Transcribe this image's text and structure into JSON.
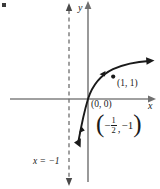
{
  "figure": {
    "type": "cartesian-graph",
    "axes": {
      "x_label": "x",
      "y_label": "y",
      "origin_label": "(0, 0)"
    },
    "asymptote": {
      "label": "x = −1",
      "equation_x": -1,
      "style": "dashed"
    },
    "points": [
      {
        "label": "(1, 1)",
        "x": 1,
        "y": 1,
        "marked": true
      },
      {
        "label_display": "(−½, −1)",
        "x": -0.5,
        "y": -1,
        "marked": false
      }
    ],
    "point2_parts": {
      "open_paren": "(",
      "minus": "−",
      "numerator": "1",
      "denominator": "2",
      "comma": ",",
      "second": "−1",
      "close_paren": ")"
    },
    "colors": {
      "axis": "#808080",
      "curve": "#1a1a1a",
      "asymptote": "#666666",
      "text": "#1a1a1a",
      "background": "#ffffff"
    }
  }
}
